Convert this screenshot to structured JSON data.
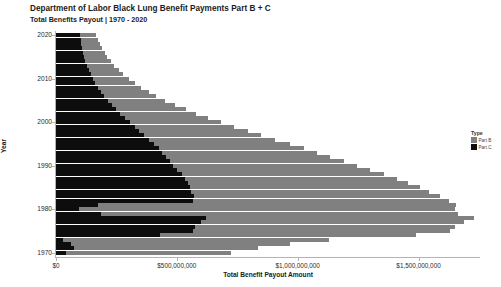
{
  "chart_data": {
    "type": "bar",
    "orientation": "horizontal",
    "stacked": true,
    "title": "Department of Labor Black Lung Benefit Payments Part B + C",
    "subtitle": "Total Benefits Payout | 1970 - 2020",
    "xlabel": "Total Benefit Payout Amount",
    "ylabel": "Year",
    "xlim": [
      0,
      1750000000
    ],
    "ylim": [
      1969,
      2021
    ],
    "grid": false,
    "legend": {
      "title": "Type",
      "position": "right",
      "entries": [
        {
          "name": "Part B",
          "color": "#808080"
        },
        {
          "name": "Part C",
          "color": "#0d0d0d"
        }
      ]
    },
    "xticks": [
      0,
      500000000,
      1000000000,
      1500000000
    ],
    "xtick_labels": [
      "$0",
      "$500,000,000",
      "$1,000,000,000",
      "$1,500,000,000"
    ],
    "yticks": [
      1970,
      1980,
      1990,
      2000,
      2010,
      2020
    ],
    "ytick_labels": [
      "1970",
      "1980",
      "1990",
      "2000",
      "2010",
      "2020"
    ],
    "categories": [
      1970,
      1971,
      1972,
      1973,
      1974,
      1975,
      1976,
      1977,
      1978,
      1979,
      1980,
      1981,
      1982,
      1983,
      1984,
      1985,
      1986,
      1987,
      1988,
      1989,
      1990,
      1991,
      1992,
      1993,
      1994,
      1995,
      1996,
      1997,
      1998,
      1999,
      2000,
      2001,
      2002,
      2003,
      2004,
      2005,
      2006,
      2007,
      2008,
      2009,
      2010,
      2011,
      2012,
      2013,
      2014,
      2015,
      2016,
      2017,
      2018,
      2019,
      2020
    ],
    "series": [
      {
        "name": "Part C",
        "color": "#0d0d0d",
        "values": [
          40000000,
          75000000,
          60000000,
          30000000,
          430000000,
          565000000,
          575000000,
          600000000,
          620000000,
          185000000,
          95000000,
          175000000,
          565000000,
          570000000,
          560000000,
          555000000,
          545000000,
          535000000,
          520000000,
          500000000,
          485000000,
          470000000,
          455000000,
          440000000,
          425000000,
          405000000,
          385000000,
          365000000,
          345000000,
          325000000,
          305000000,
          285000000,
          265000000,
          248000000,
          232000000,
          215000000,
          200000000,
          188000000,
          175000000,
          163000000,
          152000000,
          143000000,
          135000000,
          128000000,
          122000000,
          116000000,
          112000000,
          108000000,
          105000000,
          102000000,
          100000000
        ]
      },
      {
        "name": "Part B",
        "color": "#808080",
        "values": [
          685000000,
          760000000,
          910000000,
          1100000000,
          1060000000,
          1065000000,
          1075000000,
          1090000000,
          1110000000,
          1480000000,
          1555000000,
          1480000000,
          1060000000,
          1020000000,
          985000000,
          950000000,
          910000000,
          875000000,
          835000000,
          800000000,
          760000000,
          720000000,
          680000000,
          640000000,
          600000000,
          562000000,
          522000000,
          485000000,
          448000000,
          412000000,
          378000000,
          345000000,
          315000000,
          288000000,
          262000000,
          238000000,
          215000000,
          196000000,
          178000000,
          162000000,
          148000000,
          135000000,
          124000000,
          114000000,
          105000000,
          97000000,
          90000000,
          83000000,
          77000000,
          71000000,
          66000000
        ]
      }
    ]
  }
}
